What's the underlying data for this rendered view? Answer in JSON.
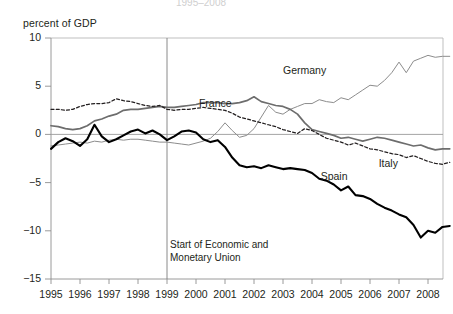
{
  "figure": {
    "faint_top_title": "1995–2008",
    "y_axis_title": "percent of GDP"
  },
  "annotation": {
    "line1": "Start of Economic and",
    "line2": "Monetary Union",
    "at_year": 1999
  },
  "chart_data": {
    "type": "line",
    "title": "",
    "subtitle": "",
    "xlabel": "",
    "ylabel": "percent of GDP",
    "xlim": [
      1995,
      2008.75
    ],
    "ylim": [
      -15,
      10
    ],
    "yticks": [
      10,
      5,
      0,
      -5,
      -10,
      -15
    ],
    "ytick_labels": [
      "10",
      "5",
      "0",
      "−5",
      "−10",
      "−15"
    ],
    "xticks": [
      1995,
      1996,
      1997,
      1998,
      1999,
      2000,
      2001,
      2002,
      2003,
      2004,
      2005,
      2006,
      2007,
      2008
    ],
    "xtick_labels": [
      "1995",
      "1996",
      "1997",
      "1998",
      "1999",
      "2000",
      "2001",
      "2002",
      "2003",
      "2004",
      "2005",
      "2006",
      "2007",
      "2008"
    ],
    "grid": false,
    "legend_position": "inline-annotations",
    "zero_line": true,
    "vline": 1999,
    "x_step_quarters": true,
    "series": [
      {
        "name": "Germany",
        "style": "thin-solid-gray",
        "color": "#8c8c8c",
        "label_x": 2003.0,
        "label_y": 6.6,
        "x": [
          1995.0,
          1995.25,
          1995.5,
          1995.75,
          1996.0,
          1996.25,
          1996.5,
          1996.75,
          1997.0,
          1997.25,
          1997.5,
          1997.75,
          1998.0,
          1998.25,
          1998.5,
          1998.75,
          1999.0,
          1999.25,
          1999.5,
          1999.75,
          2000.0,
          2000.25,
          2000.5,
          2000.75,
          2001.0,
          2001.25,
          2001.5,
          2001.75,
          2002.0,
          2002.25,
          2002.5,
          2002.75,
          2003.0,
          2003.25,
          2003.5,
          2003.75,
          2004.0,
          2004.25,
          2004.5,
          2004.75,
          2005.0,
          2005.25,
          2005.5,
          2005.75,
          2006.0,
          2006.25,
          2006.5,
          2006.75,
          2007.0,
          2007.25,
          2007.5,
          2007.75,
          2008.0,
          2008.25,
          2008.5,
          2008.75
        ],
        "values": [
          -1.2,
          -1.1,
          -1.0,
          -0.9,
          -0.8,
          -0.9,
          -0.7,
          -0.8,
          -0.6,
          -0.5,
          -0.6,
          -0.5,
          -0.5,
          -0.6,
          -0.7,
          -0.8,
          -0.8,
          -0.9,
          -1.0,
          -1.1,
          -0.9,
          -0.7,
          -0.4,
          0.3,
          1.2,
          0.4,
          -0.3,
          -0.1,
          0.6,
          1.8,
          3.0,
          2.3,
          2.1,
          2.6,
          2.9,
          3.2,
          3.2,
          3.6,
          3.4,
          3.3,
          3.8,
          3.6,
          4.1,
          4.6,
          5.1,
          5.0,
          5.6,
          6.4,
          7.5,
          6.4,
          7.6,
          7.9,
          8.2,
          8.0,
          8.1,
          8.1
        ]
      },
      {
        "name": "France",
        "style": "medium-solid-gray",
        "color": "#6d6d6d",
        "label_x": 2000.1,
        "label_y": 3.2,
        "x": [
          1995.0,
          1995.25,
          1995.5,
          1995.75,
          1996.0,
          1996.25,
          1996.5,
          1996.75,
          1997.0,
          1997.25,
          1997.5,
          1997.75,
          1998.0,
          1998.25,
          1998.5,
          1998.75,
          1999.0,
          1999.25,
          1999.5,
          1999.75,
          2000.0,
          2000.25,
          2000.5,
          2000.75,
          2001.0,
          2001.25,
          2001.5,
          2001.75,
          2002.0,
          2002.25,
          2002.5,
          2002.75,
          2003.0,
          2003.25,
          2003.5,
          2003.75,
          2004.0,
          2004.25,
          2004.5,
          2004.75,
          2005.0,
          2005.25,
          2005.5,
          2005.75,
          2006.0,
          2006.25,
          2006.5,
          2006.75,
          2007.0,
          2007.25,
          2007.5,
          2007.75,
          2008.0,
          2008.25,
          2008.5,
          2008.75
        ],
        "values": [
          0.9,
          0.8,
          0.6,
          0.5,
          0.6,
          0.9,
          1.4,
          1.6,
          1.9,
          2.1,
          2.5,
          2.6,
          2.6,
          2.7,
          2.8,
          2.9,
          2.8,
          2.8,
          2.9,
          3.0,
          3.1,
          3.3,
          3.3,
          3.3,
          3.2,
          3.2,
          3.3,
          3.5,
          3.9,
          3.4,
          3.2,
          3.0,
          2.9,
          2.6,
          2.1,
          1.2,
          0.5,
          0.3,
          0.1,
          -0.1,
          -0.4,
          -0.3,
          -0.5,
          -0.7,
          -0.5,
          -0.3,
          -0.4,
          -0.6,
          -0.8,
          -1.0,
          -1.2,
          -1.1,
          -1.4,
          -1.6,
          -1.5,
          -1.5
        ]
      },
      {
        "name": "Italy",
        "style": "dashed-black",
        "color": "#231f20",
        "label_x": 2006.3,
        "label_y": -3.1,
        "x": [
          1995.0,
          1995.25,
          1995.5,
          1995.75,
          1996.0,
          1996.25,
          1996.5,
          1996.75,
          1997.0,
          1997.25,
          1997.5,
          1997.75,
          1998.0,
          1998.25,
          1998.5,
          1998.75,
          1999.0,
          1999.25,
          1999.5,
          1999.75,
          2000.0,
          2000.25,
          2000.5,
          2000.75,
          2001.0,
          2001.25,
          2001.5,
          2001.75,
          2002.0,
          2002.25,
          2002.5,
          2002.75,
          2003.0,
          2003.25,
          2003.5,
          2003.75,
          2004.0,
          2004.25,
          2004.5,
          2004.75,
          2005.0,
          2005.25,
          2005.5,
          2005.75,
          2006.0,
          2006.25,
          2006.5,
          2006.75,
          2007.0,
          2007.25,
          2007.5,
          2007.75,
          2008.0,
          2008.25,
          2008.5,
          2008.75
        ],
        "values": [
          2.6,
          2.6,
          2.5,
          2.6,
          2.9,
          3.1,
          3.2,
          3.2,
          3.3,
          3.7,
          3.5,
          3.4,
          3.2,
          3.0,
          2.9,
          3.0,
          2.6,
          2.5,
          2.6,
          2.6,
          2.7,
          2.8,
          2.7,
          2.6,
          2.5,
          2.2,
          1.8,
          1.6,
          1.4,
          1.2,
          1.0,
          0.8,
          0.5,
          0.3,
          0.1,
          0.6,
          0.4,
          0.0,
          -0.4,
          -0.6,
          -0.8,
          -1.1,
          -0.9,
          -1.2,
          -1.5,
          -1.6,
          -1.8,
          -2.0,
          -2.1,
          -2.4,
          -2.2,
          -2.5,
          -2.8,
          -3.0,
          -3.1,
          -2.9
        ]
      },
      {
        "name": "Spain",
        "style": "thick-black",
        "color": "#000000",
        "label_x": 2004.3,
        "label_y": -4.4,
        "x": [
          1995.0,
          1995.25,
          1995.5,
          1995.75,
          1996.0,
          1996.25,
          1996.5,
          1996.75,
          1997.0,
          1997.25,
          1997.5,
          1997.75,
          1998.0,
          1998.25,
          1998.5,
          1998.75,
          1999.0,
          1999.25,
          1999.5,
          1999.75,
          2000.0,
          2000.25,
          2000.5,
          2000.75,
          2001.0,
          2001.25,
          2001.5,
          2001.75,
          2002.0,
          2002.25,
          2002.5,
          2002.75,
          2003.0,
          2003.25,
          2003.5,
          2003.75,
          2004.0,
          2004.25,
          2004.5,
          2004.75,
          2005.0,
          2005.25,
          2005.5,
          2005.75,
          2006.0,
          2006.25,
          2006.5,
          2006.75,
          2007.0,
          2007.25,
          2007.5,
          2007.75,
          2008.0,
          2008.25,
          2008.5,
          2008.75
        ],
        "values": [
          -1.5,
          -0.8,
          -0.4,
          -0.7,
          -1.2,
          -0.5,
          1.0,
          -0.2,
          -0.8,
          -0.5,
          -0.1,
          0.3,
          0.5,
          0.1,
          0.4,
          0.0,
          -0.6,
          -0.2,
          0.3,
          0.4,
          0.2,
          -0.5,
          -0.8,
          -0.6,
          -1.3,
          -2.4,
          -3.2,
          -3.4,
          -3.3,
          -3.5,
          -3.2,
          -3.4,
          -3.6,
          -3.5,
          -3.6,
          -3.7,
          -4.0,
          -4.6,
          -4.8,
          -5.2,
          -5.8,
          -5.4,
          -6.3,
          -6.4,
          -6.7,
          -7.2,
          -7.6,
          -7.9,
          -8.3,
          -8.6,
          -9.4,
          -10.7,
          -10.0,
          -10.2,
          -9.6,
          -9.5
        ]
      }
    ]
  }
}
